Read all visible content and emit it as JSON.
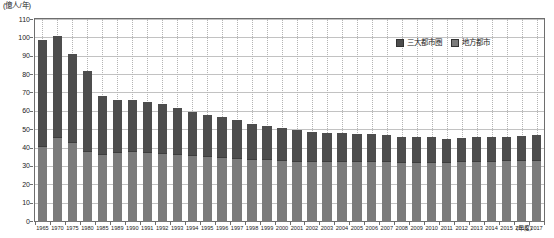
{
  "chart_data": {
    "type": "bar",
    "subtype": "stacked-bar",
    "title": "",
    "unit_caption": "(億人/年)",
    "xlabel": "(年度)",
    "ylabel": "",
    "ylim": [
      0,
      110
    ],
    "ytick_step": 10,
    "yticks": [
      0,
      10,
      20,
      30,
      40,
      50,
      60,
      70,
      80,
      90,
      100,
      110
    ],
    "grid": "horizontal-solid + vertical-dotted",
    "legend_position": "top-right",
    "categories": [
      "1965",
      "1970",
      "1975",
      "1980",
      "1985",
      "1989",
      "1990",
      "1991",
      "1992",
      "1993",
      "1994",
      "1995",
      "1996",
      "1997",
      "1998",
      "1999",
      "2000",
      "2001",
      "2002",
      "2003",
      "2004",
      "2005",
      "2006",
      "2007",
      "2008",
      "2009",
      "2010",
      "2011",
      "2012",
      "2013",
      "2014",
      "2015",
      "2016",
      "2017"
    ],
    "series": [
      {
        "name": "地方都市",
        "color": "#7b7b7b",
        "stack_position": "bottom",
        "values": [
          40.8,
          45.5,
          43.0,
          38.0,
          36.5,
          37.5,
          38.0,
          37.5,
          37.0,
          36.5,
          36.0,
          35.5,
          35.0,
          34.5,
          34.0,
          33.5,
          33.0,
          32.5,
          32.5,
          32.5,
          32.5,
          32.5,
          32.5,
          32.5,
          32.0,
          32.0,
          32.0,
          32.0,
          32.5,
          32.5,
          32.5,
          33.0,
          33.0,
          33.0
        ]
      },
      {
        "name": "三大都市圏",
        "color": "#4d4d4d",
        "stack_position": "top",
        "values": [
          57.7,
          55.2,
          48.0,
          43.5,
          31.5,
          28.5,
          28.0,
          27.5,
          26.5,
          25.0,
          23.5,
          22.5,
          21.5,
          20.5,
          19.0,
          18.0,
          17.5,
          17.0,
          16.0,
          15.5,
          15.5,
          15.0,
          15.0,
          14.5,
          14.0,
          13.5,
          13.5,
          12.5,
          12.5,
          13.0,
          13.0,
          13.0,
          13.5,
          14.0
        ]
      }
    ],
    "totals": [
      98.5,
      100.7,
      91.0,
      81.5,
      68.0,
      66.0,
      66.0,
      65.0,
      63.5,
      61.5,
      59.5,
      58.0,
      56.5,
      55.0,
      53.0,
      51.5,
      50.5,
      49.5,
      48.5,
      48.0,
      48.0,
      47.5,
      47.5,
      47.0,
      46.0,
      45.5,
      45.5,
      44.5,
      45.0,
      45.5,
      45.5,
      46.0,
      46.5,
      47.0
    ],
    "colors": {
      "series_top": "#4d4d4d",
      "series_bottom": "#7b7b7b",
      "axis": "#6e6e6e",
      "gridline": "#c2c2c2",
      "gridline_vertical": "#b4b4b4",
      "background": "#ffffff"
    }
  },
  "legend": {
    "items": [
      {
        "label": "三大都市圏",
        "swatch": "top"
      },
      {
        "label": "地方都市",
        "swatch": "bottom"
      }
    ]
  }
}
